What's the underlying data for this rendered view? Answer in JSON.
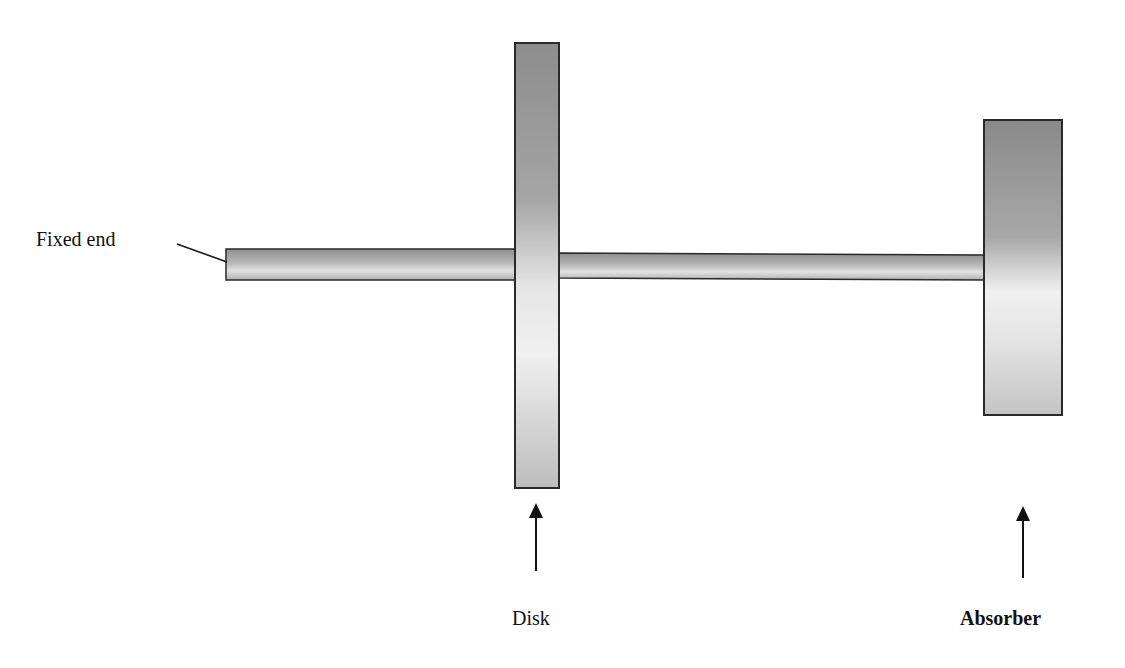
{
  "diagram": {
    "type": "mechanical-schematic",
    "labels": {
      "fixed_end": "Fixed end",
      "disk": "Disk",
      "absorber": "Absorber"
    },
    "components": [
      {
        "id": "shaft-1",
        "kind": "shaft",
        "from": "fixed end",
        "to": "disk"
      },
      {
        "id": "disk",
        "kind": "disk"
      },
      {
        "id": "shaft-2",
        "kind": "shaft",
        "from": "disk",
        "to": "absorber"
      },
      {
        "id": "absorber",
        "kind": "absorber"
      }
    ],
    "colors": {
      "outline": "#2a2a2a",
      "shade_dark": "#8c8c8c",
      "shade_light": "#f2f2f2",
      "text": "#111111"
    }
  }
}
